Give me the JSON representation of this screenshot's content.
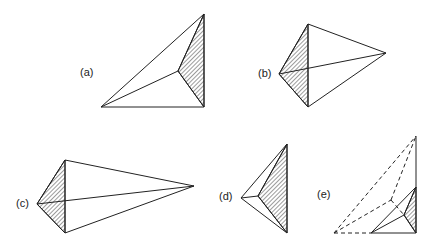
{
  "figure": {
    "panels": [
      {
        "id": "a",
        "label": "(a)",
        "label_pos": [
          80,
          76
        ],
        "vertices": {
          "top": [
            204,
            14
          ],
          "bl": [
            101,
            107
          ],
          "br": [
            204,
            107
          ],
          "in": [
            178,
            71
          ]
        },
        "edges": [
          [
            "top",
            "bl"
          ],
          [
            "bl",
            "br"
          ],
          [
            "br",
            "top"
          ],
          [
            "bl",
            "in"
          ],
          [
            "in",
            "top"
          ],
          [
            "in",
            "br"
          ]
        ],
        "hatched": [
          "top",
          "in",
          "br"
        ]
      },
      {
        "id": "b",
        "label": "(b)",
        "label_pos": [
          258,
          77
        ],
        "vertices": {
          "top": [
            308,
            24
          ],
          "left": [
            279,
            74
          ],
          "bot": [
            308,
            107
          ],
          "right": [
            386,
            53
          ]
        },
        "edges": [
          [
            "top",
            "left"
          ],
          [
            "left",
            "bot"
          ],
          [
            "top",
            "bot"
          ],
          [
            "top",
            "right"
          ],
          [
            "bot",
            "right"
          ],
          [
            "left",
            "right"
          ]
        ],
        "hatched": [
          "top",
          "left",
          "bot"
        ]
      },
      {
        "id": "c",
        "label": "(c)",
        "label_pos": [
          16,
          207
        ],
        "vertices": {
          "top": [
            65,
            160
          ],
          "left": [
            37,
            204
          ],
          "bot": [
            65,
            233
          ],
          "right": [
            194,
            186
          ]
        },
        "edges": [
          [
            "top",
            "left"
          ],
          [
            "left",
            "bot"
          ],
          [
            "top",
            "bot"
          ],
          [
            "top",
            "right"
          ],
          [
            "bot",
            "right"
          ],
          [
            "left",
            "right"
          ]
        ],
        "hatched": [
          "top",
          "left",
          "bot"
        ]
      },
      {
        "id": "d",
        "label": "(d)",
        "label_pos": [
          219,
          200
        ],
        "vertices": {
          "top": [
            287,
            144
          ],
          "left": [
            241,
            198
          ],
          "bot": [
            287,
            233
          ],
          "in": [
            258,
            196
          ]
        },
        "edges": [
          [
            "top",
            "left"
          ],
          [
            "left",
            "bot"
          ],
          [
            "top",
            "bot"
          ],
          [
            "left",
            "in"
          ],
          [
            "in",
            "top"
          ],
          [
            "in",
            "bot"
          ]
        ],
        "hatched": [
          "top",
          "in",
          "bot"
        ]
      },
      {
        "id": "e",
        "label": "(e)",
        "label_pos": [
          317,
          198
        ],
        "vertices": {
          "top": [
            416,
            136
          ],
          "far": [
            334,
            233
          ],
          "mid": [
            391,
            200
          ],
          "bl": [
            371,
            233
          ],
          "br": [
            416,
            233
          ],
          "apex": [
            416,
            187
          ],
          "in": [
            404,
            215
          ]
        },
        "edges": [
          [
            "top",
            "br"
          ],
          [
            "bl",
            "br"
          ],
          [
            "bl",
            "apex"
          ],
          [
            "bl",
            "in"
          ],
          [
            "in",
            "apex"
          ],
          [
            "in",
            "br"
          ]
        ],
        "dashed_edges": [
          [
            "far",
            "top"
          ],
          [
            "far",
            "bl"
          ],
          [
            "far",
            "mid"
          ],
          [
            "mid",
            "top"
          ],
          [
            "mid",
            "in"
          ]
        ],
        "hatched": [
          "apex",
          "in",
          "br"
        ]
      }
    ]
  }
}
